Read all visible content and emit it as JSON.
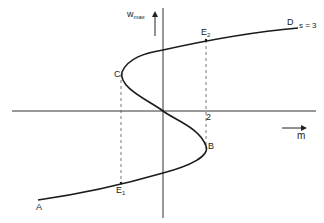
{
  "diagram": {
    "type": "s-curve bifurcation plot",
    "axes": {
      "y_label": "w",
      "y_label_subscript": "max",
      "x_label": "m",
      "x_tick": "2"
    },
    "points": {
      "A": "A",
      "B": "B",
      "C": "C",
      "D": "D",
      "E1": "E",
      "E1_sub": "1",
      "E2": "E",
      "E2_sub": "2"
    },
    "parameter_annotation": "s = 3",
    "colors": {
      "line": "#1a1a1a",
      "axis": "#333333",
      "dashed": "#555555",
      "background": "#ffffff"
    }
  }
}
